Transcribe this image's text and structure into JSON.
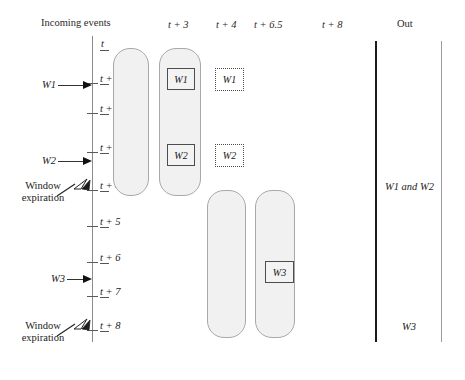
{
  "figure": {
    "type": "timeline-window-diagram",
    "width": 465,
    "height": 380,
    "background": "#ffffff",
    "line_color": "#8a8a8a",
    "bucket_fill": "#f1f1f1",
    "bucket_stroke": "#a8a8a8",
    "out_rail_color": "#1b1b1b"
  },
  "headers": {
    "incoming": "Incoming events",
    "t3": "t + 3",
    "t4": "t + 4",
    "t65": "t + 6.5",
    "t8": "t + 8",
    "out": "Out"
  },
  "axis": {
    "origin_label": "t",
    "ticks": [
      {
        "label": "t + 1",
        "y": 83
      },
      {
        "label": "t + 2",
        "y": 113
      },
      {
        "label": "t + 3",
        "y": 152
      },
      {
        "label": "t + 4",
        "y": 190
      },
      {
        "label": "t + 5",
        "y": 226
      },
      {
        "label": "t + 6",
        "y": 262
      },
      {
        "label": "t + 7",
        "y": 296
      },
      {
        "label": "t + 8",
        "y": 330
      }
    ]
  },
  "events": [
    {
      "label": "W1",
      "y": 84
    },
    {
      "label": "W2",
      "y": 160
    },
    {
      "label": "W3",
      "y": 278
    }
  ],
  "annotations": [
    {
      "line1": "Window",
      "line2": "expiration",
      "target_tick": "t + 4"
    },
    {
      "line1": "Window",
      "line2": "expiration",
      "target_tick": "t + 8"
    }
  ],
  "buckets": [
    {
      "name": "window-a-at-t3",
      "column": "t + 3",
      "contents": []
    },
    {
      "name": "window-b-at-t3",
      "column": "t + 3",
      "contents": [
        "W1",
        "W2"
      ]
    },
    {
      "name": "window-c-at-t65",
      "column": "t + 6.5",
      "contents": []
    },
    {
      "name": "window-d-at-t65",
      "column": "t + 6.5",
      "contents": [
        "W3"
      ]
    }
  ],
  "boxes": {
    "solid": [
      {
        "label": "W1"
      },
      {
        "label": "W2"
      },
      {
        "label": "W3"
      }
    ],
    "dashed": [
      {
        "label": "W1"
      },
      {
        "label": "W2"
      }
    ]
  },
  "out": {
    "first": "W1 and W2",
    "second": "W3"
  }
}
